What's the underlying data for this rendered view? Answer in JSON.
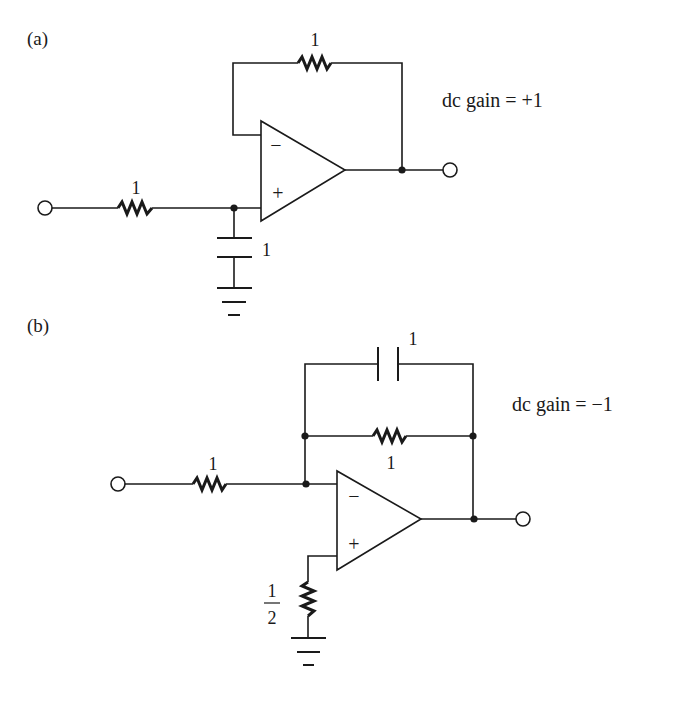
{
  "figure": {
    "panels": [
      {
        "id": "a",
        "label": "(a)",
        "gain_text": "dc gain = +1",
        "components": {
          "feedback_resistor": {
            "type": "resistor",
            "value": "1"
          },
          "input_resistor": {
            "type": "resistor",
            "value": "1"
          },
          "shunt_capacitor": {
            "type": "capacitor",
            "value": "1"
          },
          "op_amp": {
            "inverting_symbol": "−",
            "noninverting_symbol": "+"
          }
        }
      },
      {
        "id": "b",
        "label": "(b)",
        "gain_text": "dc gain = −1",
        "components": {
          "feedback_capacitor": {
            "type": "capacitor",
            "value": "1"
          },
          "feedback_resistor": {
            "type": "resistor",
            "value": "1"
          },
          "input_resistor": {
            "type": "resistor",
            "value": "1"
          },
          "bias_resistor": {
            "type": "resistor",
            "value_num": "1",
            "value_den": "2"
          },
          "op_amp": {
            "inverting_symbol": "−",
            "noninverting_symbol": "+"
          }
        }
      }
    ]
  }
}
